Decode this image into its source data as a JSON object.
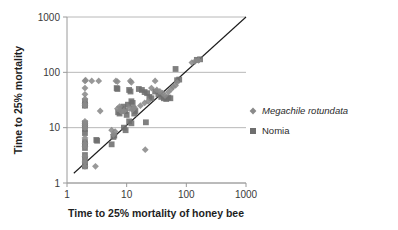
{
  "chart_data": {
    "type": "scatter",
    "title": "",
    "xlabel": "Time to 25% mortality of honey bee",
    "ylabel": "Time to 25% mortality",
    "xscale": "log",
    "yscale": "log",
    "xlim": [
      1,
      1000
    ],
    "ylim": [
      1,
      1000
    ],
    "xticks": [
      "1",
      "10",
      "100",
      "1000"
    ],
    "xtick_values": [
      1,
      10,
      100,
      1000
    ],
    "yticks": [
      "1",
      "10",
      "100",
      "1000"
    ],
    "ytick_values": [
      1,
      10,
      100,
      1000
    ],
    "grid": "horizontal",
    "legend_position": "right",
    "reference_line": {
      "name": "1:1 line",
      "from": [
        1.3,
        1.5
      ],
      "to": [
        1000,
        1000
      ],
      "color": "#1a1a1a"
    },
    "series": [
      {
        "name": "Megachile rotundata",
        "marker": "diamond",
        "color": "#8a8a8a",
        "italic": true,
        "points": [
          [
            2,
            70
          ],
          [
            2.05,
            72
          ],
          [
            2.6,
            70
          ],
          [
            3.4,
            70
          ],
          [
            2,
            52
          ],
          [
            2,
            40
          ],
          [
            2,
            33
          ],
          [
            2,
            27
          ],
          [
            2,
            25
          ],
          [
            2,
            13
          ],
          [
            2,
            12
          ],
          [
            2,
            11
          ],
          [
            2,
            10
          ],
          [
            2,
            6.5
          ],
          [
            2,
            5.2
          ],
          [
            2,
            4.6
          ],
          [
            2,
            3.0
          ],
          [
            2,
            2.4
          ],
          [
            2,
            2.0
          ],
          [
            3.0,
            2.0
          ],
          [
            3.6,
            20
          ],
          [
            6.6,
            70
          ],
          [
            7.0,
            68
          ],
          [
            11.5,
            70
          ],
          [
            12.0,
            66
          ],
          [
            7.0,
            22
          ],
          [
            7.6,
            24
          ],
          [
            8.0,
            20
          ],
          [
            9.0,
            20
          ],
          [
            11.0,
            22
          ],
          [
            12.5,
            21
          ],
          [
            13.5,
            23
          ],
          [
            5.6,
            9.0
          ],
          [
            6.0,
            7.5
          ],
          [
            6.4,
            8.5
          ],
          [
            17.0,
            25
          ],
          [
            20.0,
            28
          ],
          [
            23.0,
            30
          ],
          [
            26.0,
            52
          ],
          [
            30.0,
            70
          ],
          [
            32.0,
            48
          ],
          [
            36.0,
            45
          ],
          [
            40.0,
            42
          ],
          [
            44.0,
            38
          ],
          [
            50.0,
            44
          ],
          [
            56.0,
            50
          ],
          [
            60.0,
            55
          ],
          [
            66.0,
            58
          ],
          [
            70.0,
            66
          ],
          [
            124,
            150
          ],
          [
            140,
            158
          ],
          [
            160,
            165
          ],
          [
            20.5,
            4.0
          ]
        ]
      },
      {
        "name": "Nomia",
        "marker": "square",
        "color": "#6e6e6e",
        "italic": false,
        "points": [
          [
            2,
            30
          ],
          [
            2,
            26
          ],
          [
            2,
            25
          ],
          [
            2,
            12
          ],
          [
            2,
            11
          ],
          [
            2,
            9.5
          ],
          [
            2,
            8.0
          ],
          [
            2,
            5.5
          ],
          [
            2,
            5.0
          ],
          [
            2,
            4.3
          ],
          [
            2,
            3.2
          ],
          [
            2,
            2.6
          ],
          [
            2,
            2.1
          ],
          [
            2,
            2.0
          ],
          [
            3.1,
            6.0
          ],
          [
            3.2,
            5.8
          ],
          [
            5.6,
            5.0
          ],
          [
            6.0,
            6.8
          ],
          [
            6.2,
            7.2
          ],
          [
            6.8,
            52
          ],
          [
            7.0,
            50
          ],
          [
            7.2,
            19
          ],
          [
            7.6,
            18
          ],
          [
            8.2,
            22
          ],
          [
            8.8,
            24
          ],
          [
            9.4,
            20
          ],
          [
            10.0,
            17
          ],
          [
            10.5,
            26
          ],
          [
            11.0,
            48
          ],
          [
            11.6,
            45
          ],
          [
            12.0,
            30
          ],
          [
            12.6,
            28
          ],
          [
            13.0,
            22
          ],
          [
            13.4,
            18
          ],
          [
            14.0,
            20
          ],
          [
            11.0,
            13
          ],
          [
            12.0,
            12
          ],
          [
            9.0,
            10
          ],
          [
            9.6,
            9.0
          ],
          [
            16.0,
            50
          ],
          [
            18.0,
            48
          ],
          [
            20.0,
            44
          ],
          [
            22.0,
            42
          ],
          [
            24.0,
            36
          ],
          [
            26.0,
            34
          ],
          [
            21.0,
            12.5
          ],
          [
            30.0,
            45
          ],
          [
            34.0,
            40
          ],
          [
            38.0,
            36
          ],
          [
            42.0,
            34
          ],
          [
            46.0,
            33
          ],
          [
            50.0,
            35
          ],
          [
            54.0,
            34
          ],
          [
            66.0,
            115
          ],
          [
            70.0,
            72
          ],
          [
            76.0,
            74
          ],
          [
            150,
            168
          ],
          [
            170,
            172
          ]
        ]
      }
    ]
  },
  "legend": {
    "items": [
      {
        "label": "Megachile rotundata",
        "marker": "diamond"
      },
      {
        "label": "Nomia",
        "marker": "square"
      }
    ]
  },
  "colors": {
    "diamond": "#8a8a8a",
    "square": "#6e6e6e",
    "axis": "#9a9a9a",
    "gridline": "#b8b8b8",
    "reference_line": "#1a1a1a",
    "text": "#2b2b2b"
  }
}
